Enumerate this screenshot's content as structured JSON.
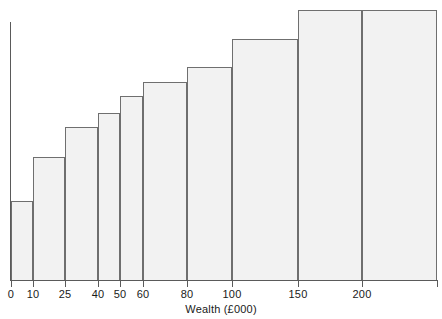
{
  "chart_data": {
    "type": "bar",
    "title": "",
    "subtitle": "",
    "xlabel": "Wealth (£000)",
    "ylabel": "",
    "grid": false,
    "legend": null,
    "xlim": [
      0,
      235
    ],
    "ylim": [
      0,
      1
    ],
    "tick_labels": [
      "0",
      "10",
      "25",
      "40",
      "50",
      "60",
      "80",
      "100",
      "150",
      "200"
    ],
    "tick_values": [
      0,
      10,
      25,
      40,
      50,
      60,
      80,
      100,
      150,
      200
    ],
    "categories": [
      "0-10",
      "10-25",
      "25-40",
      "40-50",
      "50-60",
      "60-80",
      "80-100",
      "100-150",
      "150-200",
      "200-235"
    ],
    "bin_edges": [
      0,
      10,
      25,
      40,
      50,
      60,
      80,
      100,
      150,
      200,
      235
    ],
    "values": [
      0.3,
      0.48,
      0.59,
      0.65,
      0.72,
      0.77,
      0.82,
      0.93,
      1.04,
      1.04
    ],
    "bars": [
      {
        "label": "0-10",
        "x0": 0,
        "x1": 10,
        "height": 0.3,
        "top_px": 201,
        "left_px": 11,
        "right_px": 33
      },
      {
        "label": "10-25",
        "x0": 10,
        "x1": 25,
        "height": 0.48,
        "top_px": 157,
        "left_px": 33,
        "right_px": 65
      },
      {
        "label": "25-40",
        "x0": 25,
        "x1": 40,
        "height": 0.59,
        "top_px": 127,
        "left_px": 65,
        "right_px": 98
      },
      {
        "label": "40-50",
        "x0": 40,
        "x1": 50,
        "height": 0.65,
        "top_px": 113,
        "left_px": 98,
        "right_px": 120
      },
      {
        "label": "50-60",
        "x0": 50,
        "x1": 60,
        "height": 0.72,
        "top_px": 96,
        "left_px": 120,
        "right_px": 143
      },
      {
        "label": "60-80",
        "x0": 60,
        "x1": 80,
        "height": 0.77,
        "top_px": 82,
        "left_px": 143,
        "right_px": 187
      },
      {
        "label": "80-100",
        "x0": 80,
        "x1": 100,
        "height": 0.82,
        "top_px": 67,
        "left_px": 187,
        "right_px": 232
      },
      {
        "label": "100-150",
        "x0": 100,
        "x1": 150,
        "height": 0.93,
        "top_px": 39,
        "left_px": 232,
        "right_px": 298
      },
      {
        "label": "150-200",
        "x0": 150,
        "x1": 200,
        "height": 1.04,
        "top_px": 10,
        "left_px": 298,
        "right_px": 362
      },
      {
        "label": "200-235",
        "x0": 200,
        "x1": 235,
        "height": 1.04,
        "top_px": 10,
        "left_px": 362,
        "right_px": 437
      }
    ],
    "ticks_px": [
      11,
      33,
      65,
      98,
      120,
      143,
      187,
      232,
      298,
      362,
      437
    ],
    "colors": {
      "bar_fill": "#f2f2f2",
      "bar_stroke": "#6f6f6f",
      "axis": "#5a5a5a",
      "text": "#1a1a1a",
      "background": "#ffffff"
    }
  }
}
